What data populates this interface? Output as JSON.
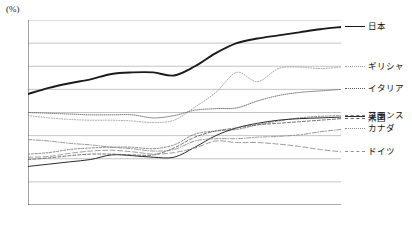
{
  "chart_data": {
    "type": "line",
    "title": "",
    "unit_label": "(%)",
    "xlabel": "",
    "ylabel": "",
    "ylim": [
      0,
      240
    ],
    "yticks": [
      0,
      30,
      60,
      90,
      120,
      150,
      180,
      210,
      240
    ],
    "grid": true,
    "legend_position": "right",
    "categories": [
      "2001",
      "2002",
      "2003",
      "2004",
      "2005",
      "2006",
      "2007",
      "2008",
      "2009",
      "2010",
      "2011",
      "2012",
      "2013",
      "2014",
      "2015",
      "2016"
    ],
    "series": [
      {
        "name": "日本",
        "style": "solid-bold",
        "color": "#1a1a1a",
        "values": [
          144,
          152,
          158,
          163,
          170,
          172,
          172,
          168,
          180,
          197,
          210,
          216,
          220,
          224,
          228,
          231
        ]
      },
      {
        "name": "ギリシャ",
        "style": "dotted",
        "color": "#9a9a9a",
        "values": [
          116,
          113,
          111,
          110,
          110,
          109,
          107,
          110,
          127,
          146,
          172,
          160,
          177,
          179,
          177,
          179
        ]
      },
      {
        "name": "イタリア",
        "style": "dotted-fine",
        "color": "#5a5a5a",
        "values": [
          120,
          119,
          118,
          117,
          117,
          117,
          113,
          116,
          123,
          125,
          126,
          135,
          142,
          146,
          148,
          150
        ]
      },
      {
        "name": "フランス",
        "style": "dashed-fine",
        "color": "#7a7a7a",
        "values": [
          66,
          68,
          72,
          74,
          75,
          75,
          73,
          78,
          92,
          96,
          98,
          104,
          109,
          113,
          115,
          116
        ]
      },
      {
        "name": "英国",
        "style": "solid-thin",
        "color": "#2a2a2a",
        "values": [
          50,
          53,
          56,
          59,
          65,
          64,
          62,
          62,
          75,
          90,
          100,
          106,
          110,
          112,
          113,
          114
        ]
      },
      {
        "name": "米国",
        "style": "dashed",
        "color": "#606060",
        "values": [
          59,
          61,
          64,
          66,
          66,
          65,
          65,
          74,
          88,
          96,
          100,
          104,
          106,
          108,
          110,
          112
        ]
      },
      {
        "name": "カナダ",
        "style": "dash-dot",
        "color": "#8a8a8a",
        "values": [
          85,
          83,
          80,
          78,
          75,
          73,
          70,
          72,
          83,
          86,
          86,
          88,
          89,
          91,
          95,
          98
        ]
      },
      {
        "name": "ドイツ",
        "style": "dashed-long",
        "color": "#909090",
        "values": [
          62,
          63,
          67,
          70,
          71,
          69,
          66,
          68,
          74,
          83,
          81,
          81,
          79,
          76,
          72,
          69
        ]
      }
    ]
  }
}
